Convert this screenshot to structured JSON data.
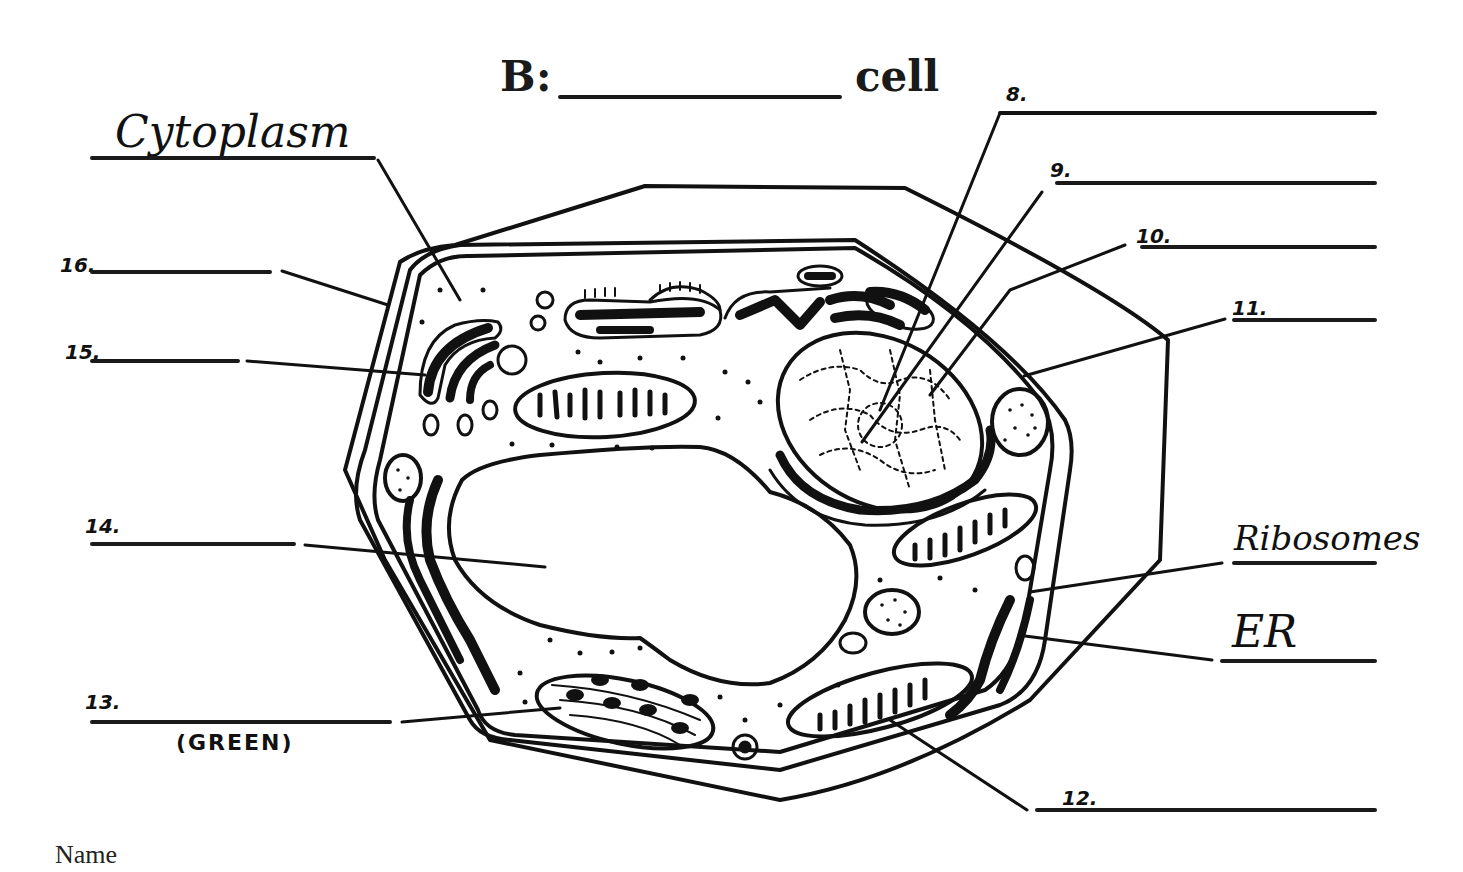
{
  "worksheet": {
    "title_prefix": "B:",
    "title_suffix": "cell",
    "footer_label": "Name"
  },
  "labels": {
    "cytoplasm": "Cytoplasm",
    "ribosomes": "Ribosomes",
    "er": "ER",
    "green_note": "(GREEN)"
  },
  "numbered_blanks": [
    {
      "id": "8",
      "text": "8."
    },
    {
      "id": "9",
      "text": "9."
    },
    {
      "id": "10",
      "text": "10."
    },
    {
      "id": "11",
      "text": "11."
    },
    {
      "id": "12",
      "text": "12."
    },
    {
      "id": "13",
      "text": "13."
    },
    {
      "id": "14",
      "text": "14."
    },
    {
      "id": "15",
      "text": "15."
    },
    {
      "id": "16",
      "text": "16."
    }
  ],
  "colors": {
    "ink": "#111111",
    "paper": "#ffffff"
  }
}
